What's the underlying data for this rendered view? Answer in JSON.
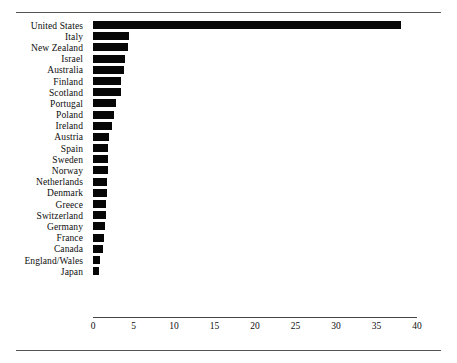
{
  "figure": {
    "name": "horizontal-bar-chart",
    "background_color": "#ffffff",
    "bar_color": "#070707",
    "rule_color": "#555555",
    "top_rule": true,
    "bottom_rule": true
  },
  "chart_data": {
    "type": "bar",
    "orientation": "horizontal",
    "title": "",
    "subtitle": "",
    "xlabel": "",
    "ylabel": "",
    "xlim": [
      0,
      40
    ],
    "ylim": null,
    "grid": false,
    "legend": null,
    "xticks": [
      0,
      5,
      10,
      15,
      20,
      25,
      30,
      35,
      40
    ],
    "xtick_labels": [
      "0",
      "5",
      "10",
      "15",
      "20",
      "25",
      "30",
      "35",
      "40"
    ],
    "categories": [
      "United States",
      "Italy",
      "New Zealand",
      "Israel",
      "Australia",
      "Finland",
      "Scotland",
      "Portugal",
      "Poland",
      "Ireland",
      "Austria",
      "Spain",
      "Sweden",
      "Norway",
      "Netherlands",
      "Denmark",
      "Greece",
      "Switzerland",
      "Germany",
      "France",
      "Canada",
      "England/Wales",
      "Japan"
    ],
    "values": [
      38.0,
      4.4,
      4.3,
      3.9,
      3.8,
      3.5,
      3.5,
      2.8,
      2.6,
      2.4,
      2.0,
      1.9,
      1.8,
      1.8,
      1.7,
      1.7,
      1.6,
      1.6,
      1.5,
      1.3,
      1.2,
      0.9,
      0.8
    ]
  }
}
